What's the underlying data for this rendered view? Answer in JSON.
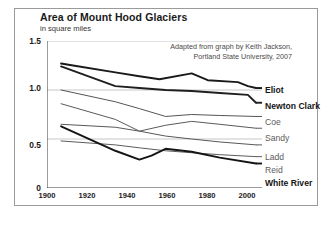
{
  "title": "Area of Mount Hood Glaciers",
  "subtitle": "in square miles",
  "credit_line1": "Adapted from graph by Keith Jackson,",
  "credit_line2": "Portland State University, 2007",
  "axis": {
    "y_ticks": [
      "1.5",
      "1.0",
      "0.5",
      "0"
    ],
    "x_ticks": [
      "1900",
      "1920",
      "1940",
      "1960",
      "1980",
      "2000"
    ]
  },
  "labels": {
    "eliot": "Eliot",
    "newton_clark": "Newton Clark",
    "coe": "Coe",
    "sandy": "Sandy",
    "ladd": "Ladd",
    "reid": "Reid",
    "white_river": "White River"
  },
  "chart_data": {
    "type": "line",
    "title": "Area of Mount Hood Glaciers",
    "subtitle": "in square miles",
    "xlabel": "",
    "ylabel": "in square miles",
    "xlim": [
      1900,
      2007
    ],
    "ylim": [
      0,
      1.5
    ],
    "y_ticks": [
      0,
      0.5,
      1.0,
      1.5
    ],
    "x_ticks": [
      1900,
      1920,
      1940,
      1960,
      1980,
      2000
    ],
    "grid": "horizontal",
    "legend_position": "right-inline-labels",
    "annotation": "Adapted from graph by Keith Jackson, Portland State University, 2007",
    "series": [
      {
        "name": "Eliot",
        "emphasis": "bold",
        "color": "#1a1a1a",
        "x": [
          1907,
          1913,
          1934,
          1946,
          1956,
          1972,
          1980,
          1995,
          2000,
          2004
        ],
        "values": [
          1.27,
          1.25,
          1.18,
          1.14,
          1.11,
          1.17,
          1.1,
          1.08,
          1.04,
          1.02
        ]
      },
      {
        "name": "Newton Clark",
        "emphasis": "bold",
        "color": "#1f1f1f",
        "x": [
          1907,
          1934,
          1946,
          1959,
          1972,
          1986,
          2000,
          2004
        ],
        "values": [
          1.24,
          1.04,
          1.02,
          1.0,
          0.99,
          0.97,
          0.95,
          0.87
        ]
      },
      {
        "name": "Coe",
        "emphasis": "regular",
        "color": "#555555",
        "x": [
          1907,
          1934,
          1946,
          1959,
          1972,
          1986,
          2004
        ],
        "values": [
          1.0,
          0.88,
          0.81,
          0.73,
          0.75,
          0.74,
          0.73
        ]
      },
      {
        "name": "Sandy",
        "emphasis": "regular",
        "color": "#5a5a5a",
        "x": [
          1907,
          1934,
          1946,
          1959,
          1972,
          1986,
          2004
        ],
        "values": [
          0.86,
          0.7,
          0.58,
          0.64,
          0.68,
          0.65,
          0.61
        ]
      },
      {
        "name": "Ladd",
        "emphasis": "regular",
        "color": "#585858",
        "x": [
          1907,
          1934,
          1946,
          1959,
          1972,
          1986,
          2004
        ],
        "values": [
          0.65,
          0.62,
          0.58,
          0.53,
          0.5,
          0.47,
          0.44
        ]
      },
      {
        "name": "Reid",
        "emphasis": "regular",
        "color": "#5c5c5c",
        "x": [
          1907,
          1934,
          1946,
          1959,
          1972,
          1986,
          2004
        ],
        "values": [
          0.48,
          0.44,
          0.41,
          0.38,
          0.36,
          0.34,
          0.32
        ]
      },
      {
        "name": "White River",
        "emphasis": "bold",
        "color": "#151515",
        "x": [
          1907,
          1934,
          1946,
          1952,
          1959,
          1972,
          1986,
          2004
        ],
        "values": [
          0.63,
          0.38,
          0.29,
          0.33,
          0.4,
          0.37,
          0.31,
          0.25
        ]
      }
    ]
  }
}
